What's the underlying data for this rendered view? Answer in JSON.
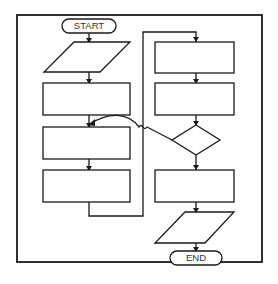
{
  "diagram": {
    "type": "flowchart",
    "colors": {
      "stroke": "#1a1a1a",
      "fill": "#ffffff",
      "text": "#333333"
    },
    "nodes": [
      {
        "id": "start",
        "shape": "terminator",
        "label": "START"
      },
      {
        "id": "io1",
        "shape": "parallelogram",
        "label": ""
      },
      {
        "id": "proc1",
        "shape": "rectangle",
        "label": ""
      },
      {
        "id": "proc2",
        "shape": "rectangle",
        "label": ""
      },
      {
        "id": "proc3",
        "shape": "rectangle",
        "label": ""
      },
      {
        "id": "proc4",
        "shape": "rectangle",
        "label": ""
      },
      {
        "id": "proc5",
        "shape": "rectangle",
        "label": ""
      },
      {
        "id": "decision",
        "shape": "diamond",
        "label": ""
      },
      {
        "id": "proc6",
        "shape": "rectangle",
        "label": ""
      },
      {
        "id": "io2",
        "shape": "parallelogram",
        "label": ""
      },
      {
        "id": "end",
        "shape": "terminator",
        "label": "END"
      }
    ],
    "edges": [
      [
        "start",
        "io1"
      ],
      [
        "io1",
        "proc1"
      ],
      [
        "proc1",
        "proc2"
      ],
      [
        "proc2",
        "proc3"
      ],
      [
        "proc3",
        "proc4"
      ],
      [
        "proc4",
        "proc5"
      ],
      [
        "proc5",
        "decision"
      ],
      [
        "decision",
        "proc2"
      ],
      [
        "decision",
        "proc6"
      ],
      [
        "proc6",
        "io2"
      ],
      [
        "io2",
        "end"
      ]
    ]
  }
}
